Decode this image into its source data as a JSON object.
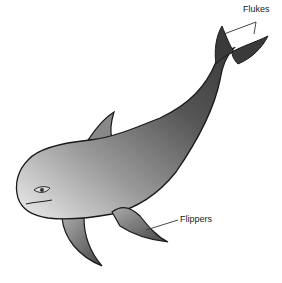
{
  "diagram": {
    "labels": [
      {
        "id": "flukes",
        "text": "Flukes"
      },
      {
        "id": "flippers",
        "text": "Flippers"
      }
    ],
    "colors": {
      "outline": "#1a1a1a",
      "body_light": "#e6e6e6",
      "body_dark": "#3c3c3c",
      "leader_line": "#333333"
    }
  }
}
